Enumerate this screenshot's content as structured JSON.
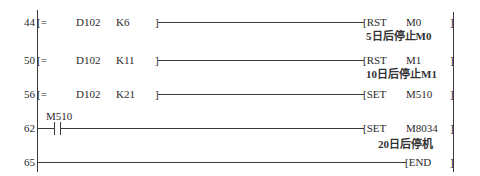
{
  "ladder": {
    "rungs": [
      {
        "step": "44",
        "condition": {
          "type": "compare",
          "open": "[=",
          "op1": "D102",
          "op2": "K6",
          "close": "]"
        },
        "output": {
          "open": "[RST",
          "instr": "RST",
          "operand": "M0",
          "close": "]"
        },
        "comment": "5日后停止M0"
      },
      {
        "step": "50",
        "condition": {
          "type": "compare",
          "open": "[=",
          "op1": "D102",
          "op2": "K11",
          "close": "]"
        },
        "output": {
          "open": "[RST",
          "instr": "RST",
          "operand": "M1",
          "close": "]"
        },
        "comment": "10日后停止M1"
      },
      {
        "step": "56",
        "condition": {
          "type": "compare",
          "open": "[=",
          "op1": "D102",
          "op2": "K21",
          "close": "]"
        },
        "output": {
          "open": "[SET",
          "instr": "SET",
          "operand": "M510",
          "close": "]"
        },
        "comment": ""
      },
      {
        "step": "62",
        "condition": {
          "type": "contact-no",
          "device": "M510"
        },
        "output": {
          "open": "[SET",
          "instr": "SET",
          "operand": "M8034",
          "close": "]"
        },
        "comment": "20日后停机"
      },
      {
        "step": "65",
        "condition": {
          "type": "none"
        },
        "output": {
          "open": "[END",
          "instr": "END",
          "operand": "",
          "close": "]"
        },
        "comment": ""
      }
    ]
  },
  "colors": {
    "line": "#3a3a3a",
    "text": "#2a2a2a",
    "background": "#ffffff"
  }
}
